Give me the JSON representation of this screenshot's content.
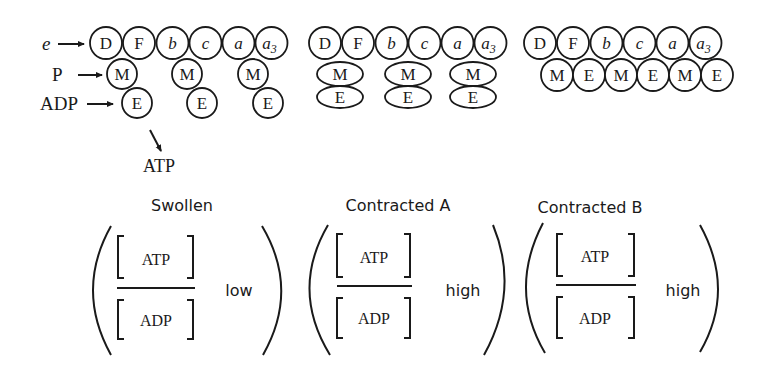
{
  "figure": {
    "colors": {
      "ink": "#1a1a1a",
      "background": "#ffffff"
    },
    "input_labels": {
      "electron": "e",
      "phosphate": "P",
      "adp": "ADP"
    },
    "output_label": "ATP",
    "chain_components": [
      "D",
      "F",
      "b",
      "c",
      "a",
      "a3"
    ],
    "panels": [
      {
        "id": "swollen",
        "title": "Swollen",
        "chain": [
          "D",
          "F",
          "b",
          "c",
          "a",
          "a3"
        ],
        "attachments": [
          [
            "M",
            "E"
          ],
          [
            "M",
            "E"
          ],
          [
            "M",
            "E"
          ]
        ],
        "attachment_style": "separated circles (M then E hanging below chain)",
        "ratio": {
          "numerator": "ATP",
          "denominator": "ADP",
          "level": "low"
        }
      },
      {
        "id": "contracted-a",
        "title": "Contracted A",
        "chain": [
          "D",
          "F",
          "b",
          "c",
          "a",
          "a3"
        ],
        "attachments": [
          [
            "M",
            "E"
          ],
          [
            "M",
            "E"
          ],
          [
            "M",
            "E"
          ]
        ],
        "attachment_style": "flattened ovals stacked under chain",
        "ratio": {
          "numerator": "ATP",
          "denominator": "ADP",
          "level": "high"
        }
      },
      {
        "id": "contracted-b",
        "title": "Contracted B",
        "chain": [
          "D",
          "F",
          "b",
          "c",
          "a",
          "a3"
        ],
        "second_row": [
          "M",
          "E",
          "M",
          "E",
          "M",
          "E"
        ],
        "attachment_style": "single row of alternating M and E circles",
        "ratio": {
          "numerator": "ATP",
          "denominator": "ADP",
          "level": "high"
        }
      }
    ]
  }
}
